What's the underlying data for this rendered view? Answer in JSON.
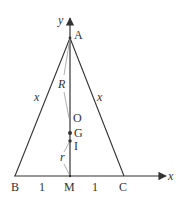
{
  "diagram": {
    "type": "geometry",
    "colors": {
      "line": "#333333",
      "thin_line": "#9a9a9a",
      "background": "#ffffff"
    },
    "axes": {
      "x_label": "x",
      "y_label": "y"
    },
    "points": {
      "A": {
        "label": "A"
      },
      "B": {
        "label": "B"
      },
      "C": {
        "label": "C"
      },
      "M": {
        "label": "M"
      },
      "O": {
        "label": "O"
      },
      "G": {
        "label": "G"
      },
      "I": {
        "label": "I"
      }
    },
    "segment_labels": {
      "AB": "x",
      "AC": "x",
      "BM": "1",
      "MC": "1",
      "R": "R",
      "r": "r"
    }
  }
}
